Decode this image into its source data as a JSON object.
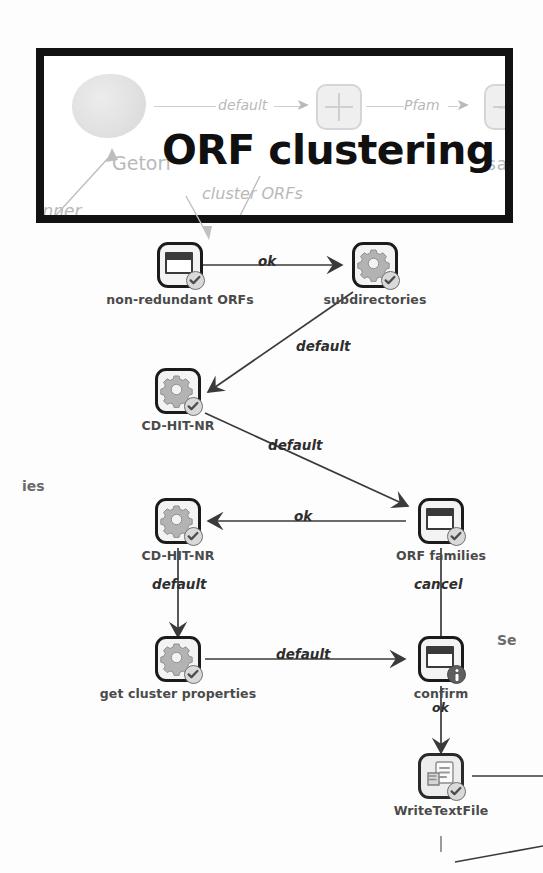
{
  "banner": {
    "title": "ORF clustering",
    "ghost_nodes": [
      {
        "name": "blob-node",
        "kind": "blob"
      },
      {
        "name": "tree-node",
        "kind": "node"
      },
      {
        "name": "doc-node",
        "kind": "node"
      }
    ],
    "ghost_edges": [
      {
        "label": "default"
      },
      {
        "label": "Pfam"
      }
    ],
    "ghost_texts": [
      {
        "label": "Getorf"
      },
      {
        "label": "anner"
      },
      {
        "label": "cluster ORFs"
      },
      {
        "label": "save o"
      }
    ]
  },
  "graph": {
    "nodes": [
      {
        "id": "non-redundant-orfs",
        "label": "non-redundant ORFs",
        "glyph": "window-icon",
        "badge": "check-badge"
      },
      {
        "id": "subdirectories",
        "label": "subdirectories",
        "glyph": "gear-icon",
        "badge": "check-badge"
      },
      {
        "id": "cd-hit-nr-1",
        "label": "CD-HIT-NR",
        "glyph": "gear-icon",
        "badge": "check-badge"
      },
      {
        "id": "cd-hit-nr-2",
        "label": "CD-HIT-NR",
        "glyph": "gear-icon",
        "badge": "check-badge"
      },
      {
        "id": "orf-families",
        "label": "ORF families",
        "glyph": "window-icon",
        "badge": "check-badge"
      },
      {
        "id": "get-cluster-properties",
        "label": "get cluster properties",
        "glyph": "gear-icon",
        "badge": "check-badge"
      },
      {
        "id": "confirm",
        "label": "confirm",
        "glyph": "window-icon",
        "badge": "info-badge"
      },
      {
        "id": "write-text-file",
        "label": "WriteTextFile",
        "glyph": "file-icon",
        "badge": "check-badge"
      }
    ],
    "edges": [
      {
        "from": "non-redundant-orfs",
        "to": "subdirectories",
        "label": "ok"
      },
      {
        "from": "subdirectories",
        "to": "cd-hit-nr-1",
        "label": "default"
      },
      {
        "from": "cd-hit-nr-1",
        "to": "orf-families",
        "label": "default"
      },
      {
        "from": "orf-families",
        "to": "cd-hit-nr-2",
        "label": "ok"
      },
      {
        "from": "cd-hit-nr-2",
        "to": "get-cluster-properties",
        "label": "default"
      },
      {
        "from": "get-cluster-properties",
        "to": "confirm",
        "label": "default"
      },
      {
        "from": "orf-families",
        "to": "confirm",
        "label": "cancel"
      },
      {
        "from": "confirm",
        "to": "write-text-file",
        "label": "ok"
      }
    ]
  },
  "stray_text": [
    {
      "label": "ies"
    },
    {
      "label": "Se"
    }
  ],
  "colors": {
    "banner_border": "#121212",
    "node_border": "#1b1b1b",
    "label_text": "#4a4a4a",
    "edge": "#3a3a3a",
    "ghost": "#b9b9b9",
    "page": "#ffffff"
  }
}
